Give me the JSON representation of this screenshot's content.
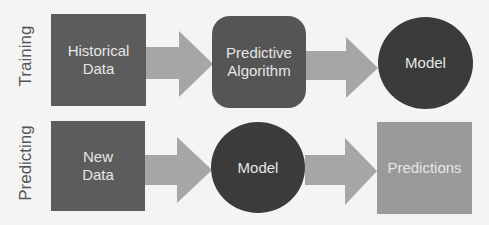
{
  "rows": {
    "training": {
      "label": "Training",
      "steps": [
        {
          "label": "Historical\nData",
          "shape": "square",
          "color": "#5c5c5c"
        },
        {
          "label": "Predictive\nAlgorithm",
          "shape": "rounded-square",
          "color": "#555555"
        },
        {
          "label": "Model",
          "shape": "circle",
          "color": "#3b3b3b"
        }
      ]
    },
    "predicting": {
      "label": "Predicting",
      "steps": [
        {
          "label": "New\nData",
          "shape": "square",
          "color": "#5c5c5c"
        },
        {
          "label": "Model",
          "shape": "circle",
          "color": "#3b3b3b"
        },
        {
          "label": "Predictions",
          "shape": "square",
          "color": "#9a9a9a"
        }
      ]
    }
  },
  "colors": {
    "background": "#f4f4f4",
    "arrow": "#a6a6a6",
    "label_text": "#555555",
    "node_text": "#e6e6e6"
  }
}
